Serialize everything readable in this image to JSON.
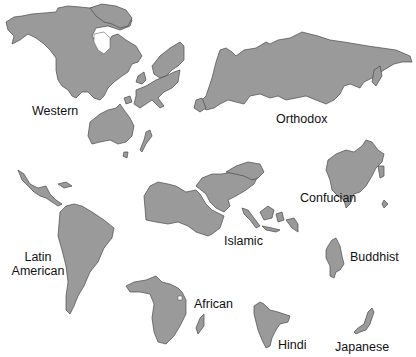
{
  "colors": {
    "land": "#9a9a9a",
    "outline": "#4a4a4a",
    "background": "#ffffff",
    "label_text": "#111111"
  },
  "civilizations": [
    {
      "id": "western",
      "label": "Western",
      "regions": [
        "North America",
        "Western Europe",
        "Australia",
        "New Zealand"
      ]
    },
    {
      "id": "orthodox",
      "label": "Orthodox",
      "regions": [
        "Russia",
        "Eastern Europe"
      ]
    },
    {
      "id": "latin-american",
      "label_line1": "Latin",
      "label_line2": "American",
      "regions": [
        "Central America",
        "South America",
        "Caribbean"
      ]
    },
    {
      "id": "islamic",
      "label": "Islamic",
      "regions": [
        "North Africa",
        "Middle East",
        "Central Asia",
        "Indonesia",
        "Malaysia"
      ]
    },
    {
      "id": "african",
      "label": "African",
      "regions": [
        "Sub-Saharan Africa",
        "Madagascar"
      ]
    },
    {
      "id": "hindi",
      "label": "Hindi",
      "regions": [
        "India"
      ]
    },
    {
      "id": "confucian",
      "label": "Confucian",
      "regions": [
        "China",
        "Korea",
        "Taiwan"
      ]
    },
    {
      "id": "buddhist",
      "label": "Buddhist",
      "regions": [
        "Southeast Asia"
      ]
    },
    {
      "id": "japanese",
      "label": "Japanese",
      "regions": [
        "Japan"
      ]
    }
  ]
}
